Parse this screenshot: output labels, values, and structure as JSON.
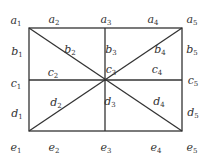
{
  "diagram": {
    "type": "rectangle-grid-with-diagonals",
    "rect": {
      "x1": 29,
      "y1": 28,
      "x2": 182,
      "y2": 131
    },
    "center": {
      "x": 105,
      "y": 80
    },
    "line_color": "#333333",
    "labels": [
      {
        "id": "a1",
        "letter": "a",
        "sub": "1",
        "x": 16,
        "y": 21
      },
      {
        "id": "a2",
        "letter": "a",
        "sub": "2",
        "x": 54,
        "y": 20
      },
      {
        "id": "a3",
        "letter": "a",
        "sub": "3",
        "x": 106,
        "y": 20
      },
      {
        "id": "a4",
        "letter": "a",
        "sub": "4",
        "x": 153,
        "y": 20
      },
      {
        "id": "a5",
        "letter": "a",
        "sub": "5",
        "x": 192,
        "y": 20
      },
      {
        "id": "b1",
        "letter": "b",
        "sub": "1",
        "x": 17,
        "y": 52
      },
      {
        "id": "b2",
        "letter": "b",
        "sub": "2",
        "x": 70,
        "y": 50
      },
      {
        "id": "b3",
        "letter": "b",
        "sub": "3",
        "x": 111,
        "y": 50
      },
      {
        "id": "b4",
        "letter": "b",
        "sub": "4",
        "x": 160,
        "y": 50
      },
      {
        "id": "b5",
        "letter": "b",
        "sub": "5",
        "x": 192,
        "y": 50
      },
      {
        "id": "c1",
        "letter": "c",
        "sub": "1",
        "x": 16,
        "y": 84
      },
      {
        "id": "c2",
        "letter": "c",
        "sub": "2",
        "x": 53,
        "y": 73
      },
      {
        "id": "c3",
        "letter": "c",
        "sub": "3",
        "x": 111,
        "y": 70
      },
      {
        "id": "c4",
        "letter": "c",
        "sub": "4",
        "x": 157,
        "y": 70
      },
      {
        "id": "c5",
        "letter": "c",
        "sub": "5",
        "x": 193,
        "y": 81
      },
      {
        "id": "d1",
        "letter": "d",
        "sub": "1",
        "x": 17,
        "y": 114
      },
      {
        "id": "d2",
        "letter": "d",
        "sub": "2",
        "x": 56,
        "y": 103
      },
      {
        "id": "d3",
        "letter": "d",
        "sub": "3",
        "x": 110,
        "y": 102
      },
      {
        "id": "d4",
        "letter": "d",
        "sub": "4",
        "x": 159,
        "y": 102
      },
      {
        "id": "d5",
        "letter": "d",
        "sub": "5",
        "x": 193,
        "y": 113
      },
      {
        "id": "e1",
        "letter": "e",
        "sub": "1",
        "x": 16,
        "y": 148
      },
      {
        "id": "e2",
        "letter": "e",
        "sub": "2",
        "x": 54,
        "y": 148
      },
      {
        "id": "e3",
        "letter": "e",
        "sub": "3",
        "x": 106,
        "y": 148
      },
      {
        "id": "e4",
        "letter": "e",
        "sub": "4",
        "x": 156,
        "y": 148
      },
      {
        "id": "e5",
        "letter": "e",
        "sub": "5",
        "x": 192,
        "y": 148
      }
    ]
  }
}
